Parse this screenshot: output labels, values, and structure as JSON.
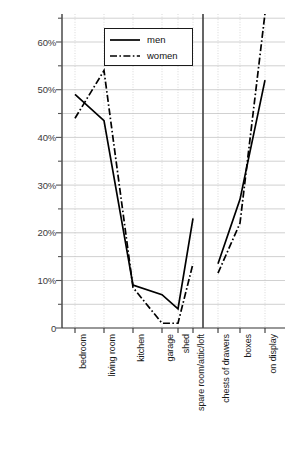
{
  "chart_data": {
    "type": "line",
    "title": "",
    "xlabel": "",
    "ylabel": "",
    "ylim": [
      0,
      65
    ],
    "yticks": [
      0,
      5,
      10,
      15,
      20,
      25,
      30,
      35,
      40,
      45,
      50,
      55,
      60,
      65
    ],
    "ytick_labels": [
      "0",
      "",
      "10%",
      "",
      "20%",
      "",
      "30%",
      "",
      "40%",
      "",
      "50%",
      "",
      "60%",
      ""
    ],
    "ytick_labels_major": [
      "0",
      "10%",
      "20%",
      "30%",
      "40%",
      "50%",
      "60%"
    ],
    "grid": true,
    "legend_position": "top-center",
    "panel_divider_after": "spare room/attic/loft",
    "categories": [
      "bedroom",
      "living room",
      "kitchen",
      "garage",
      "shed",
      "spare room/attic/loft",
      "chests of drawers",
      "boxes",
      "on display"
    ],
    "series": [
      {
        "name": "men",
        "style": "solid",
        "color": "#000000",
        "values": [
          49,
          43.5,
          9,
          7,
          4,
          23,
          13.5,
          27,
          52
        ]
      },
      {
        "name": "women",
        "style": "dash-dot",
        "color": "#000000",
        "values": [
          44,
          54,
          8.5,
          1,
          1,
          13.5,
          11.5,
          22,
          66
        ]
      }
    ]
  },
  "legend": {
    "items": [
      {
        "label": "men",
        "style": "solid"
      },
      {
        "label": "women",
        "style": "dash-dot"
      }
    ]
  }
}
